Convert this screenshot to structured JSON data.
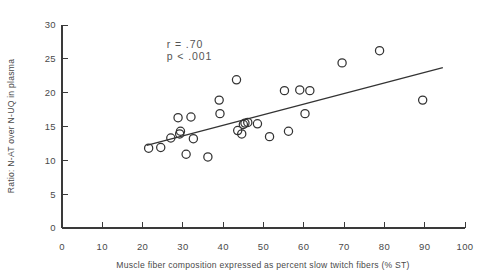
{
  "chart_data": {
    "type": "scatter",
    "title": "",
    "xlabel": "Muscle fiber composition expressed as percent slow twitch fibers (% ST)",
    "ylabel": "Ratio: N-AT over N-UQ in plasma",
    "xlim": [
      0,
      100
    ],
    "ylim": [
      0,
      30
    ],
    "xticks": [
      0,
      10,
      20,
      30,
      40,
      50,
      60,
      70,
      80,
      90,
      100
    ],
    "yticks": [
      0,
      5,
      10,
      15,
      20,
      25,
      30
    ],
    "xtick_labels": [
      "0",
      "10",
      "20",
      "30",
      "40",
      "50",
      "60",
      "70",
      "80",
      "90",
      "100"
    ],
    "ytick_labels": [
      "0",
      "5",
      "10",
      "15",
      "20",
      "25",
      "30"
    ],
    "grid": false,
    "legend": false,
    "marker": "open-circle",
    "points": [
      {
        "x": 21.5,
        "y": 11.8
      },
      {
        "x": 24.5,
        "y": 11.9
      },
      {
        "x": 27.0,
        "y": 13.3
      },
      {
        "x": 28.8,
        "y": 16.3
      },
      {
        "x": 29.2,
        "y": 13.9
      },
      {
        "x": 29.4,
        "y": 14.3
      },
      {
        "x": 30.8,
        "y": 10.9
      },
      {
        "x": 32.0,
        "y": 16.4
      },
      {
        "x": 32.6,
        "y": 13.2
      },
      {
        "x": 36.2,
        "y": 10.5
      },
      {
        "x": 39.0,
        "y": 18.9
      },
      {
        "x": 39.2,
        "y": 16.9
      },
      {
        "x": 43.3,
        "y": 21.9
      },
      {
        "x": 43.6,
        "y": 14.4
      },
      {
        "x": 44.6,
        "y": 13.9
      },
      {
        "x": 45.0,
        "y": 15.3
      },
      {
        "x": 45.4,
        "y": 15.5
      },
      {
        "x": 46.1,
        "y": 15.6
      },
      {
        "x": 48.5,
        "y": 15.4
      },
      {
        "x": 51.5,
        "y": 13.5
      },
      {
        "x": 55.2,
        "y": 20.3
      },
      {
        "x": 56.2,
        "y": 14.3
      },
      {
        "x": 59.0,
        "y": 20.4
      },
      {
        "x": 60.3,
        "y": 16.9
      },
      {
        "x": 61.5,
        "y": 20.3
      },
      {
        "x": 69.5,
        "y": 24.4
      },
      {
        "x": 78.8,
        "y": 26.2
      },
      {
        "x": 89.5,
        "y": 18.9
      }
    ],
    "fit_line": {
      "x_start": 21.0,
      "y_start": 12.2,
      "x_end": 94.5,
      "y_end": 23.7
    },
    "annotations": [
      {
        "text": "r = .70",
        "x": 26,
        "y": 26.6
      },
      {
        "text": "p < .001",
        "x": 26,
        "y": 24.9
      }
    ]
  }
}
